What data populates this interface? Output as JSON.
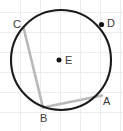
{
  "figure": {
    "kind": "circle-geometry-diagram",
    "canvas": {
      "width": 123,
      "height": 131,
      "background": "#ffffff"
    },
    "grid": {
      "visible": true,
      "color": "#ececee",
      "spacing": 20,
      "x_lines": [
        20,
        40,
        60,
        80,
        100,
        120
      ],
      "y_lines": [
        12,
        32,
        52,
        72,
        92,
        112
      ]
    },
    "circle": {
      "name": "circle-E",
      "center_x": 61,
      "center_y": 60,
      "radius": 50,
      "stroke": "#1b1b1b",
      "stroke_width": 2.1,
      "fill": "none"
    },
    "points": [
      {
        "id": "C",
        "label": "C",
        "x": 23.5,
        "y": 27.5,
        "label_x": 13,
        "label_y": 28,
        "on_circle": true,
        "dot": false
      },
      {
        "id": "D",
        "label": "D",
        "x": 101.5,
        "y": 24.5,
        "label_x": 107,
        "label_y": 27,
        "on_circle": true,
        "dot": true,
        "dot_radius": 2.6
      },
      {
        "id": "A",
        "label": "A",
        "x": 102.0,
        "y": 95.5,
        "label_x": 103,
        "label_y": 105,
        "on_circle": true,
        "dot": false
      },
      {
        "id": "B",
        "label": "B",
        "x": 43.0,
        "y": 107.5,
        "label_x": 40,
        "label_y": 122,
        "on_circle": true,
        "dot": false
      },
      {
        "id": "E",
        "label": "E",
        "x": 59.0,
        "y": 60.0,
        "label_x": 65,
        "label_y": 64,
        "on_circle": false,
        "is_center": true,
        "dot": true,
        "dot_radius": 2.5
      }
    ],
    "chords": [
      {
        "id": "CB",
        "label": "chord C to B",
        "from": "C",
        "to": "B",
        "x1": 23.5,
        "y1": 27.5,
        "x2": 43.0,
        "y2": 107.5,
        "stroke": "#b9b9b9",
        "stroke_width": 2.6
      },
      {
        "id": "BA",
        "label": "chord B to A",
        "from": "B",
        "to": "A",
        "x1": 43.0,
        "y1": 107.5,
        "x2": 102.0,
        "y2": 95.5,
        "stroke": "#b9b9b9",
        "stroke_width": 2.6
      }
    ]
  }
}
